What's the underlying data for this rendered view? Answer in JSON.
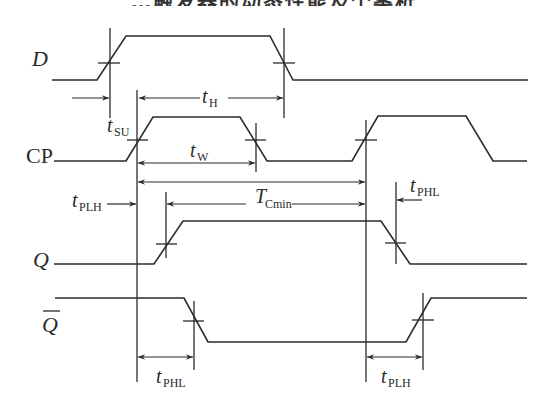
{
  "header": {
    "title_clipped": "…触发器的动态性能及个案析"
  },
  "signals": [
    {
      "id": "D",
      "label": "D",
      "italic": true,
      "overbar": false
    },
    {
      "id": "CP",
      "label": "CP",
      "italic": false,
      "overbar": false
    },
    {
      "id": "Q",
      "label": "Q",
      "italic": true,
      "overbar": false
    },
    {
      "id": "Qbar",
      "label": "Q",
      "italic": true,
      "overbar": true
    }
  ],
  "timing_labels": {
    "t_su": {
      "main": "t",
      "sub": "SU"
    },
    "t_h": {
      "main": "t",
      "sub": "H"
    },
    "t_w": {
      "main": "t",
      "sub": "W"
    },
    "t_plh_left": {
      "main": "t",
      "sub": "PLH"
    },
    "t_cmin": {
      "main": "T",
      "sub": "Cmin"
    },
    "t_phl_right": {
      "main": "t",
      "sub": "PHL"
    },
    "t_phl_bottom": {
      "main": "t",
      "sub": "PHL"
    },
    "t_plh_bottom": {
      "main": "t",
      "sub": "PLH"
    }
  },
  "colors": {
    "line": "#2b2b2b",
    "background": "#ffffff"
  }
}
